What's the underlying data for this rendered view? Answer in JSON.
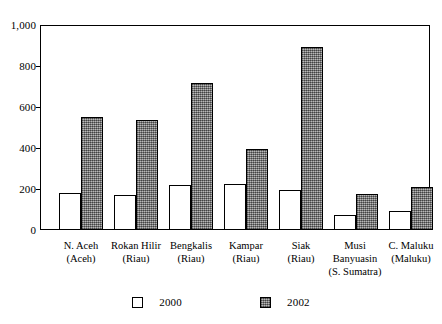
{
  "chart_data": {
    "type": "bar",
    "title": "",
    "subtitle": "",
    "xlabel": "",
    "ylabel": "",
    "ylim": [
      0,
      1000
    ],
    "ytick_labels": [
      "1,000",
      "800",
      "600",
      "400",
      "200",
      "0"
    ],
    "yticks": [
      1000,
      800,
      600,
      400,
      200,
      0
    ],
    "grid": false,
    "legend_position": "bottom-center",
    "categories": [
      "N. Aceh\n(Aceh)",
      "Rokan Hilir\n(Riau)",
      "Bengkalis\n(Riau)",
      "Kampar\n(Riau)",
      "Siak\n(Riau)",
      "Musi\nBanyuasin\n(S. Sumatra)",
      "C. Maluku\n(Maluku)"
    ],
    "category_lines": [
      [
        "N. Aceh",
        "(Aceh)"
      ],
      [
        "Rokan Hilir",
        "(Riau)"
      ],
      [
        "Bengkalis",
        "(Riau)"
      ],
      [
        "Kampar",
        "(Riau)"
      ],
      [
        "Siak",
        "(Riau)"
      ],
      [
        "Musi",
        "Banyuasin",
        "(S. Sumatra)"
      ],
      [
        "C. Maluku",
        "(Maluku)"
      ]
    ],
    "series": [
      {
        "name": "2000",
        "color": "#ffffff",
        "values": [
          180,
          170,
          220,
          225,
          195,
          72,
          95
        ]
      },
      {
        "name": "2002",
        "color": "#8a8a8a",
        "values": [
          553,
          537,
          720,
          398,
          898,
          178,
          213
        ]
      }
    ]
  },
  "legend": {
    "items": [
      {
        "label": "2000",
        "swatch": "white-square-icon"
      },
      {
        "label": "2002",
        "swatch": "hatched-square-icon"
      }
    ]
  }
}
